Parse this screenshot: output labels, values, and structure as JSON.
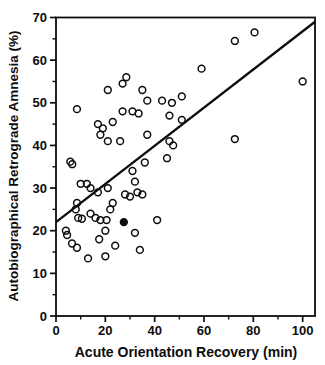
{
  "figure": {
    "background": "#ffffff",
    "ink_color": "#0d0d0d"
  },
  "chart_data": {
    "type": "scatter",
    "title": "",
    "xlabel": "Acute Orientation Recovery (min)",
    "ylabel": "Autobiographical Retrograde Amnesia (%)",
    "xlim": [
      0,
      105
    ],
    "ylim": [
      0,
      70
    ],
    "x_major_ticks": [
      0,
      20,
      40,
      60,
      80,
      100
    ],
    "x_minor_step": 10,
    "y_major_ticks": [
      0,
      10,
      20,
      30,
      40,
      50,
      60,
      70
    ],
    "y_minor_step": 5,
    "grid": false,
    "legend": "none",
    "marker": "open-circle",
    "marker_color": "#0d0d0d",
    "points": [
      [
        80.5,
        66.5
      ],
      [
        72.5,
        64.5
      ],
      [
        59,
        58
      ],
      [
        28.5,
        56
      ],
      [
        100,
        55
      ],
      [
        27,
        54.5
      ],
      [
        35,
        53
      ],
      [
        21,
        53
      ],
      [
        51,
        51.5
      ],
      [
        37,
        50.5
      ],
      [
        43,
        50.5
      ],
      [
        47,
        50
      ],
      [
        8.5,
        48.5
      ],
      [
        27,
        48
      ],
      [
        31,
        48
      ],
      [
        33.5,
        47.5
      ],
      [
        46,
        47
      ],
      [
        51,
        46
      ],
      [
        23,
        45.5
      ],
      [
        17,
        45
      ],
      [
        19,
        44
      ],
      [
        18,
        42.5
      ],
      [
        37,
        42.5
      ],
      [
        72.5,
        41.5
      ],
      [
        21,
        41
      ],
      [
        26,
        41
      ],
      [
        46,
        41
      ],
      [
        47.5,
        40
      ],
      [
        45,
        37
      ],
      [
        36,
        36
      ],
      [
        5.8,
        36.2
      ],
      [
        6.6,
        35.6
      ],
      [
        31,
        34
      ],
      [
        32,
        31.5
      ],
      [
        10,
        31
      ],
      [
        12.5,
        31
      ],
      [
        14,
        30
      ],
      [
        21,
        30
      ],
      [
        17,
        29
      ],
      [
        33,
        29
      ],
      [
        28,
        28.5
      ],
      [
        35,
        28.5
      ],
      [
        30,
        28
      ],
      [
        8.5,
        26.5
      ],
      [
        23,
        26.5
      ],
      [
        8,
        25
      ],
      [
        22,
        25
      ],
      [
        14,
        24
      ],
      [
        9,
        23
      ],
      [
        10.5,
        22.8
      ],
      [
        16,
        23
      ],
      [
        18,
        22.5
      ],
      [
        20.5,
        22.5
      ],
      [
        41,
        22.5
      ],
      [
        4,
        20
      ],
      [
        20,
        20
      ],
      [
        32,
        19.5
      ],
      [
        4.5,
        19
      ],
      [
        17.5,
        18
      ],
      [
        6.5,
        17
      ],
      [
        24,
        16.5
      ],
      [
        8.5,
        16
      ],
      [
        34,
        15.5
      ],
      [
        20,
        14
      ],
      [
        13,
        13.5
      ]
    ],
    "filled_points": [
      [
        27.5,
        22
      ]
    ],
    "regression_line": {
      "x1": 0,
      "y1": 22,
      "x2": 105,
      "y2": 69
    }
  }
}
